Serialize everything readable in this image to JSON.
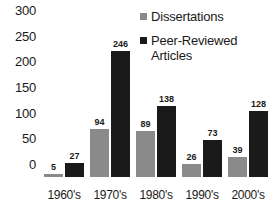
{
  "chart_data": {
    "type": "bar",
    "title": "",
    "subtitle": "",
    "xlabel": "",
    "ylabel": "",
    "categories": [
      "1960's",
      "1970's",
      "1980's",
      "1990's",
      "2000's"
    ],
    "series": [
      {
        "name": "Dissertations",
        "color": "#8a8a8a",
        "values": [
          5,
          94,
          89,
          26,
          39
        ]
      },
      {
        "name": "Peer-Reviewed Articles",
        "color": "#1a1a1a",
        "values": [
          27,
          246,
          138,
          73,
          128
        ]
      }
    ],
    "ylim": [
      0,
      300
    ],
    "yticks": [
      0,
      50,
      100,
      150,
      200,
      250,
      300
    ],
    "ytick_labels": [
      "0",
      "50",
      "100",
      "150",
      "200",
      "250",
      "300"
    ],
    "grid": false,
    "legend_position": "top-right",
    "data_labels": true,
    "legend": [
      {
        "label": "Dissertations",
        "color": "#8a8a8a"
      },
      {
        "label": "Peer-Reviewed Articles",
        "color": "#1a1a1a"
      }
    ]
  }
}
